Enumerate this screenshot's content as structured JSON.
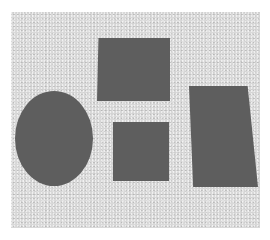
{
  "image": {
    "description": "Photograph of four dark gray flat shapes (one ellipse, three quadrilaterals) on a light speckled gray background",
    "background_color": "#d9d9d9",
    "shape_color": "#5e5e5e",
    "shapes": [
      {
        "type": "ellipse",
        "x": 15,
        "y": 91,
        "w": 78,
        "h": 95
      },
      {
        "type": "quadrilateral",
        "x": 97,
        "y": 38,
        "w": 73,
        "h": 63
      },
      {
        "type": "quadrilateral",
        "x": 113,
        "y": 122,
        "w": 56,
        "h": 59
      },
      {
        "type": "quadrilateral",
        "x": 189,
        "y": 86,
        "w": 69,
        "h": 101
      }
    ]
  }
}
